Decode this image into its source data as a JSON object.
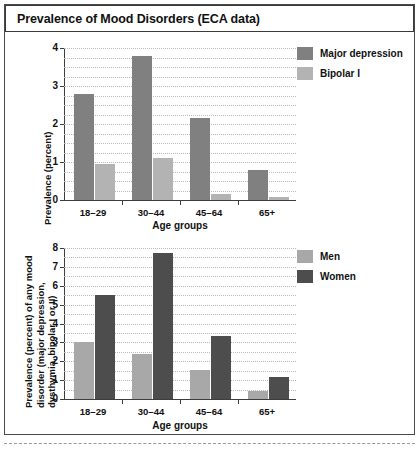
{
  "figure": {
    "title": "Prevalence of Mood Disorders (ECA data)"
  },
  "colors": {
    "major_depression": "#808080",
    "bipolar_i": "#b3b3b3",
    "men": "#a8a8a8",
    "women": "#4d4d4d",
    "axis": "#3d3d3d",
    "grid": "#b9b9b9",
    "frame": "#4a4a4a"
  },
  "chart_data": [
    {
      "type": "bar",
      "id": "mood-disorders-by-diagnosis",
      "title": "",
      "xlabel": "Age groups",
      "ylabel": "Prevalence (percent)",
      "categories": [
        "18–29",
        "30–44",
        "45–64",
        "65+"
      ],
      "ylim": [
        0,
        4
      ],
      "yticks": [
        0,
        1,
        2,
        3,
        4
      ],
      "ytick_labels": [
        "0",
        "1",
        "2",
        "3",
        "4"
      ],
      "grid": true,
      "grid_step": 0.25,
      "legend_position": "right",
      "series": [
        {
          "name": "Major depression",
          "color": "#808080",
          "values": [
            2.8,
            3.8,
            2.15,
            0.8
          ]
        },
        {
          "name": "Bipolar I",
          "color": "#b3b3b3",
          "values": [
            0.95,
            1.1,
            0.15,
            0.07
          ]
        }
      ]
    },
    {
      "type": "bar",
      "id": "mood-disorders-by-sex",
      "title": "",
      "xlabel": "Age groups",
      "ylabel": "Prevalence (percent) of any mood disorder (major depression, dysthymia, bipolar I or II)",
      "ylabel_lines": [
        "Prevalence (percent) of any mood",
        "disorder (major depression,",
        "dysthymia, bipolar I or II)"
      ],
      "categories": [
        "18–29",
        "30–44",
        "45–64",
        "65+"
      ],
      "ylim": [
        0,
        8
      ],
      "yticks": [
        0,
        1,
        2,
        3,
        4,
        5,
        6,
        7,
        8
      ],
      "ytick_labels": [
        "0",
        "1",
        "2",
        "3",
        "4",
        "5",
        "6",
        "7",
        "8"
      ],
      "grid": true,
      "grid_step": 0.5,
      "legend_position": "right",
      "series": [
        {
          "name": "Men",
          "color": "#a8a8a8",
          "values": [
            3.0,
            2.4,
            1.55,
            0.4
          ]
        },
        {
          "name": "Women",
          "color": "#4d4d4d",
          "values": [
            5.5,
            7.75,
            3.35,
            1.15
          ]
        }
      ]
    }
  ]
}
